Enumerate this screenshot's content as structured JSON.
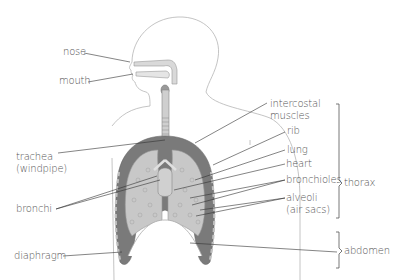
{
  "labels": {
    "nose": "nose",
    "mouth": "mouth",
    "trachea_line1": "trachea",
    "trachea_line2": "(windpipe)",
    "bronchi": "bronchi",
    "diaphragm": "diaphragm",
    "intercostal_line1": "intercostal",
    "intercostal_line2": "muscles",
    "rib": "rib",
    "lung": "lung",
    "heart": "heart",
    "bronchioles": "bronchioles",
    "alveoli_line1": "alveoli",
    "alveoli_line2": "(air sacs)",
    "thorax": "thorax",
    "abdomen": "abdomen"
  },
  "colors": {
    "outline": "#b5b5b5",
    "pleura_dark": "#7a7a7a",
    "lung_tissue": "#c8c8c8",
    "airway": "#d9d9d9",
    "leader_line": "#333333",
    "text": "#555555"
  }
}
